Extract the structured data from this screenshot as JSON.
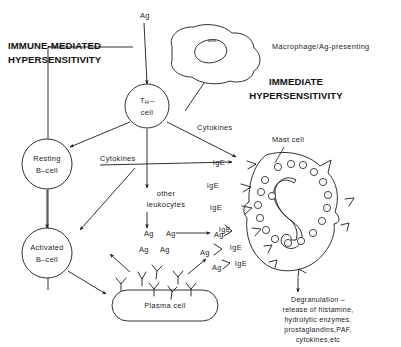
{
  "figure": {
    "background_color": "#ffffff",
    "ink_color": "#1a1a1a"
  },
  "headings": {
    "left_line1": "IMMUNE-MEDIATED",
    "left_line2": "HYPERSENSITIVITY",
    "right_line1": "IMMEDIATE",
    "right_line2": "HYPERSENSITIVITY"
  },
  "labels": {
    "antigen_top": "Ag",
    "macrophage": "Macrophage/Ag-presenting",
    "th_cell_line1": "T",
    "th_cell_sub": "H",
    "th_cell_dash": "–",
    "th_cell_line2": "cell",
    "resting_b_line1": "Resting",
    "resting_b_line2": "B–cell",
    "activated_b_line1": "Activated",
    "activated_b_line2": "B–cell",
    "plasma_cell": "Plasma cell",
    "cytokines_left": "Cytokines",
    "cytokines_right": "Cytokines",
    "other_leukocytes_line1": "other",
    "other_leukocytes_line2": "leukocytes",
    "mast_cell": "Mast cell"
  },
  "antigen_cluster": {
    "label": "Ag",
    "items": [
      {
        "x": 144,
        "y": 234
      },
      {
        "x": 166,
        "y": 234
      },
      {
        "x": 139,
        "y": 250
      },
      {
        "x": 160,
        "y": 250
      }
    ]
  },
  "bound_antigens": {
    "label": "Ag",
    "items": [
      {
        "x": 214,
        "y": 235
      },
      {
        "x": 200,
        "y": 253
      },
      {
        "x": 212,
        "y": 268
      }
    ]
  },
  "ige_receptors": {
    "label": "IgE",
    "items": [
      {
        "x": 225,
        "y": 163
      },
      {
        "x": 219,
        "y": 186
      },
      {
        "x": 222,
        "y": 208
      },
      {
        "x": 231,
        "y": 230
      },
      {
        "x": 242,
        "y": 248
      },
      {
        "x": 247,
        "y": 264
      }
    ]
  },
  "degranulation": {
    "line1": "Degranulation –",
    "line2": "release of histamine,",
    "line3": "hydrolytic enzymes,",
    "line4": "prostaglandins,PAF,",
    "line5": "cytokines,etc"
  },
  "free_antibodies": {
    "name": "free-antibody-y-shape",
    "count": 7
  },
  "mast_cell_granules": {
    "name": "mast-cell-granule",
    "count": 18
  }
}
